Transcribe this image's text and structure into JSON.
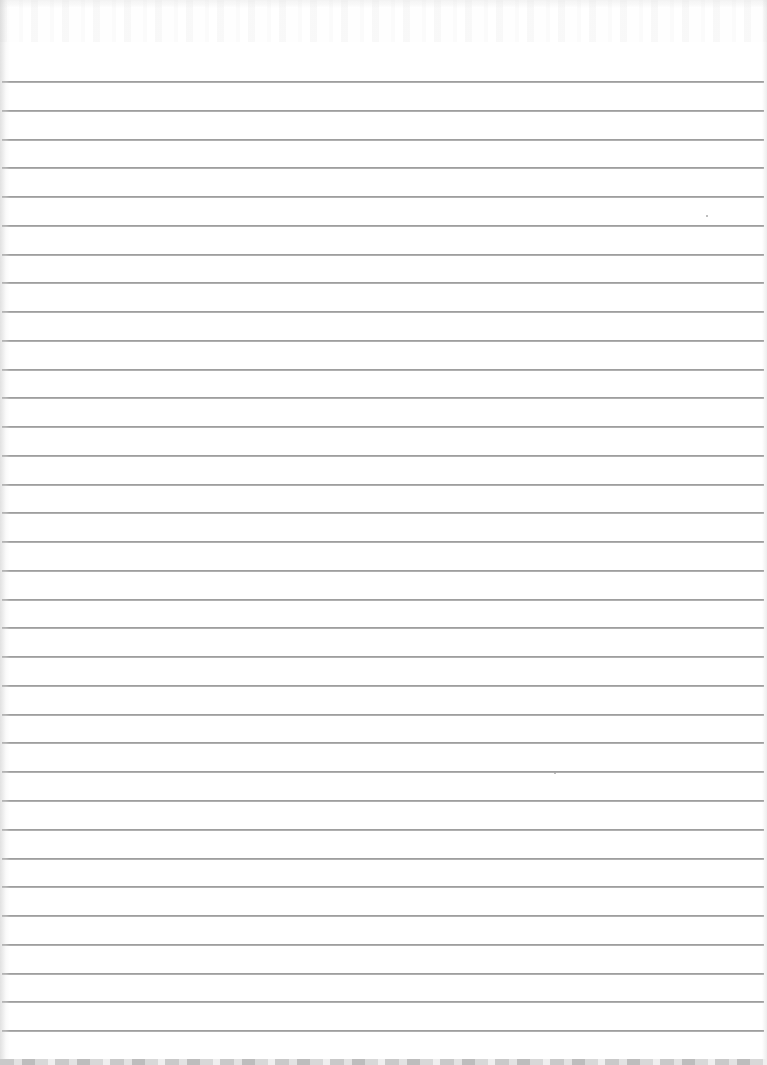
{
  "document": {
    "type": "lined-paper-scan",
    "background_color": "#ffffff",
    "rule_color": "#9e9e9e",
    "rule_count": 35,
    "first_rule_y": 81,
    "rule_spacing": 28.76,
    "rule_left": 2,
    "rule_width": 762,
    "text_content": "",
    "specks": [
      {
        "x": 706,
        "y": 215
      },
      {
        "x": 554,
        "y": 772
      }
    ]
  }
}
